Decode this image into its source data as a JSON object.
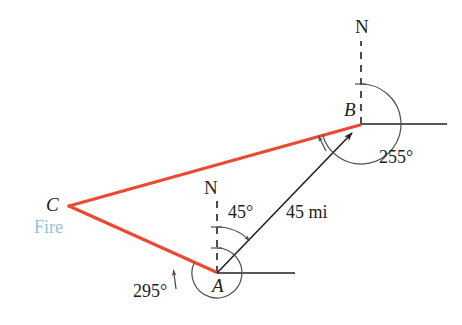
{
  "figure": {
    "kind": "bearing-triangle-diagram",
    "background": "#ffffff",
    "colors": {
      "route_red": "#ea4a33",
      "line_black": "#231f20",
      "fire_blue": "#8ec4e2",
      "arc_gray": "#4d4d4d"
    }
  },
  "vertices": {
    "a": {
      "label": "A",
      "x": 217,
      "y": 273
    },
    "b": {
      "label": "B",
      "x": 361,
      "y": 124
    },
    "c": {
      "label": "C",
      "x": 69,
      "y": 206
    }
  },
  "labels": {
    "vertex_a": "A",
    "vertex_b": "B",
    "vertex_c": "C",
    "fire": "Fire",
    "north_at_a": "N",
    "north_at_b": "N",
    "angle_45": "45°",
    "angle_295": "295°",
    "angle_255": "255°",
    "distance_ab": "45 mi"
  },
  "measurements": {
    "bearing_a_to_b_deg": 45,
    "bearing_a_to_c_deg": 295,
    "bearing_b_to_c_deg": 255,
    "distance_a_to_b": "45 mi"
  }
}
